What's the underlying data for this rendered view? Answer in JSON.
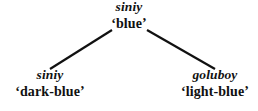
{
  "figure": {
    "type": "lexical-tree-diagram",
    "background_color": "#ffffff",
    "line_color": "#111111"
  },
  "tree": {
    "root": {
      "term": "siniy",
      "gloss": "‘blue’"
    },
    "children": [
      {
        "term": "siniy",
        "gloss": "‘dark-blue’"
      },
      {
        "term": "goluboy",
        "gloss": "‘light-blue’"
      }
    ]
  },
  "edges": [
    {
      "name": "edge-root-to-left",
      "x1": 112,
      "y1": 30,
      "x2": 50,
      "y2": 69
    },
    {
      "name": "edge-root-to-right",
      "x1": 147,
      "y1": 30,
      "x2": 215,
      "y2": 69
    }
  ]
}
